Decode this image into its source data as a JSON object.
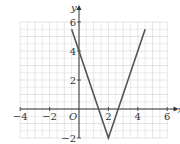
{
  "chart_data": {
    "type": "line",
    "title": "",
    "xlabel": "x",
    "ylabel": "y",
    "origin_label": "O",
    "xlim": [
      -4,
      6.5
    ],
    "ylim": [
      -2,
      7
    ],
    "grid": true,
    "grid_minor_step": 0.5,
    "x_ticks": [
      -4,
      -2,
      2,
      4,
      6
    ],
    "x_tick_labels": [
      "−4",
      "−2",
      "2",
      "4",
      "6"
    ],
    "y_ticks": [
      6,
      4,
      2,
      -2
    ],
    "y_tick_labels": [
      "6",
      "4",
      "2",
      "−2"
    ],
    "series": [
      {
        "name": "y = 3|x − 2| − 2",
        "x": [
          -0.5,
          0,
          2,
          4.5
        ],
        "y": [
          5.5,
          4,
          -2,
          5.5
        ]
      }
    ],
    "colors": {
      "line": "#555555",
      "axis": "#333333",
      "grid": "#d9d9d9",
      "grid_major": "#c8c8c8"
    }
  }
}
